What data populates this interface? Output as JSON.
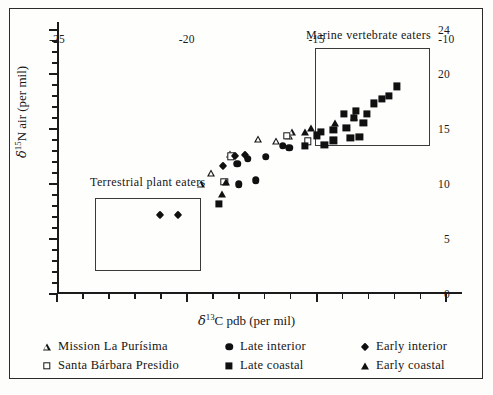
{
  "figure": {
    "background_color": "#fdfdfc",
    "frame_color": "#2b2b2b"
  },
  "axes": {
    "x_title_prefix": "δ",
    "x_title_sup": "13",
    "x_title_rest": "C pdb (per mil)",
    "y_title_prefix": "δ",
    "y_title_sup": "15",
    "y_title_rest": "N air (per mil)",
    "x_ticks_major": [
      "-25",
      "-20",
      "-15",
      "-10"
    ],
    "y_ticks_major": [
      "0",
      "5",
      "10",
      "15",
      "20",
      "24"
    ]
  },
  "annotations": {
    "marine_label": "Marine vertebrate eaters",
    "terrestrial_label": "Terrestrial plant eaters"
  },
  "legend": {
    "entries": [
      {
        "marker": "triangle-open",
        "label": "Mission La Purísima",
        "column": 0,
        "row": 0
      },
      {
        "marker": "square-open",
        "label": "Santa Bárbara Presidio",
        "column": 0,
        "row": 1
      },
      {
        "marker": "circle-filled",
        "label": "Late interior",
        "column": 1,
        "row": 0
      },
      {
        "marker": "square-filled",
        "label": "Late coastal",
        "column": 1,
        "row": 1
      },
      {
        "marker": "diamond-filled",
        "label": "Early interior",
        "column": 2,
        "row": 0
      },
      {
        "marker": "triangle-filled",
        "label": "Early coastal",
        "column": 2,
        "row": 1
      }
    ]
  },
  "chart_data": {
    "type": "scatter",
    "title": "",
    "xlabel": "δ13C pdb (per mil)",
    "ylabel": "δ15N air (per mil)",
    "xlim": [
      -25,
      -9.4
    ],
    "ylim": [
      0,
      24.7
    ],
    "x_ticks_major": [
      -25,
      -20,
      -15,
      -10
    ],
    "y_ticks_major": [
      0,
      5,
      10,
      15,
      20,
      24
    ],
    "x_tick_step_minor": 1,
    "y_tick_step_minor": 1,
    "grid": false,
    "legend_position": "below-plot",
    "annotation_boxes": [
      {
        "label": "Marine vertebrate eaters",
        "x0": -15.05,
        "x1": -10.65,
        "y0": 13.4,
        "y1": 22.35,
        "label_x": -13.0,
        "label_y": 23.5
      },
      {
        "label": "Terrestrial plant eaters",
        "x0": -23.55,
        "x1": -19.45,
        "y0": 2.05,
        "y1": 8.75,
        "label_x": -21.5,
        "label_y": 10.2
      }
    ],
    "series": [
      {
        "name": "Mission La Purísima",
        "marker": "triangle-open",
        "points": [
          [
            -18.35,
            12.75
          ],
          [
            -19.05,
            10.95
          ],
          [
            -19.45,
            9.95
          ],
          [
            -17.25,
            14.05
          ],
          [
            -16.55,
            13.85
          ],
          [
            -16.05,
            14.35
          ],
          [
            -15.95,
            14.75
          ]
        ]
      },
      {
        "name": "Santa Bárbara Presidio",
        "marker": "square-open",
        "points": [
          [
            -18.3,
            12.5
          ],
          [
            -18.55,
            10.2
          ],
          [
            -16.15,
            14.35
          ],
          [
            -15.35,
            13.85
          ]
        ]
      },
      {
        "name": "Late interior",
        "marker": "circle-filled",
        "points": [
          [
            -18.05,
            11.85
          ],
          [
            -17.65,
            12.3
          ],
          [
            -18.0,
            9.95
          ],
          [
            -17.35,
            10.35
          ],
          [
            -16.95,
            12.45
          ],
          [
            -16.3,
            13.45
          ],
          [
            -16.05,
            13.3
          ]
        ]
      },
      {
        "name": "Late coastal",
        "marker": "square-filled",
        "points": [
          [
            -18.75,
            8.2
          ],
          [
            -15.45,
            13.45
          ],
          [
            -15.0,
            14.4
          ],
          [
            -14.85,
            14.75
          ],
          [
            -14.7,
            13.55
          ],
          [
            -14.35,
            14.9
          ],
          [
            -14.35,
            13.95
          ],
          [
            -13.95,
            16.35
          ],
          [
            -13.85,
            15.1
          ],
          [
            -13.7,
            14.15
          ],
          [
            -13.55,
            16.0
          ],
          [
            -13.5,
            16.65
          ],
          [
            -13.35,
            14.3
          ],
          [
            -13.2,
            15.55
          ],
          [
            -13.05,
            16.35
          ],
          [
            -12.8,
            17.3
          ],
          [
            -12.5,
            17.75
          ],
          [
            -12.2,
            18.0
          ],
          [
            -11.9,
            18.85
          ]
        ]
      },
      {
        "name": "Early interior",
        "marker": "diamond-filled",
        "points": [
          [
            -21.05,
            7.2
          ],
          [
            -20.35,
            7.2
          ],
          [
            -18.6,
            11.65
          ],
          [
            -18.15,
            12.55
          ],
          [
            -17.75,
            12.65
          ]
        ]
      },
      {
        "name": "Early coastal",
        "marker": "triangle-filled",
        "points": [
          [
            -18.65,
            9.05
          ],
          [
            -18.5,
            10.2
          ],
          [
            -15.45,
            14.75
          ],
          [
            -15.2,
            15.05
          ],
          [
            -14.3,
            15.55
          ],
          [
            -13.55,
            16.05
          ]
        ]
      }
    ]
  }
}
